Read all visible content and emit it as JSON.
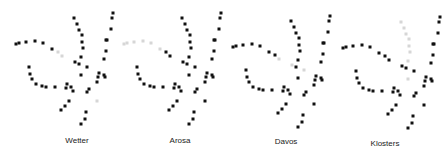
{
  "panels": [
    {
      "id": "wetter",
      "label": "Wetter",
      "faded_nodes": [
        "a6",
        "a7",
        "x3"
      ]
    },
    {
      "id": "arosa",
      "label": "Arosa",
      "faded_nodes": [
        "a0",
        "a1",
        "a2",
        "a3",
        "a4",
        "a5"
      ]
    },
    {
      "id": "davos",
      "label": "Davos",
      "faded_nodes": [
        "a7",
        "v7",
        "v9"
      ]
    },
    {
      "id": "klosters",
      "label": "Klosters",
      "faded_nodes": [
        "v0",
        "v1",
        "v2",
        "v3",
        "v4",
        "v5",
        "v6",
        "c0"
      ]
    }
  ],
  "colors": {
    "node": "#111111",
    "faded": "#d6d6d6",
    "label": "#222222"
  }
}
